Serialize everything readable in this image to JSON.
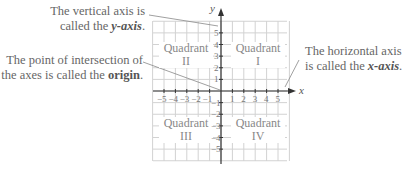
{
  "annotations": {
    "y_axis": {
      "line1": "The vertical axis is",
      "line2_pre": "called the ",
      "line2_bold": "y-axis",
      "line2_post": "."
    },
    "origin": {
      "line1": "The point of intersection of",
      "line2_pre": "the axes is called the ",
      "line2_bold": "origin",
      "line2_post": "."
    },
    "x_axis": {
      "line1": "The horizontal axis",
      "line2_pre": "is called the ",
      "line2_bold": "x-axis",
      "line2_post": "."
    }
  },
  "quadrants": [
    {
      "id": "I",
      "word": "Quadrant",
      "numeral": "I"
    },
    {
      "id": "II",
      "word": "Quadrant",
      "numeral": "II"
    },
    {
      "id": "III",
      "word": "Quadrant",
      "numeral": "III"
    },
    {
      "id": "IV",
      "word": "Quadrant",
      "numeral": "IV"
    }
  ],
  "axes": {
    "x_label": "x",
    "y_label": "y",
    "x_ticks": [
      "-5",
      "-4",
      "-3",
      "-2",
      "-1",
      "1",
      "2",
      "3",
      "4",
      "5"
    ],
    "y_ticks": [
      "5",
      "4",
      "3",
      "2",
      "1",
      "-1",
      "-2",
      "-3",
      "-4",
      "-5"
    ]
  },
  "colors": {
    "grid": "#d0d0d0",
    "axis": "#333333",
    "text": "#666666",
    "leader": "#888888"
  }
}
